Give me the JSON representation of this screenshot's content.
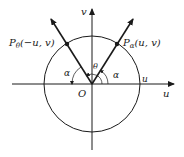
{
  "diagram": {
    "axes": {
      "horizontal_label": "u",
      "vertical_label": "v",
      "origin_label": "O"
    },
    "circle_intercept_label": "u",
    "points": [
      {
        "name": "P",
        "subscript": "α",
        "coords": "(u, v)"
      },
      {
        "name": "P",
        "subscript": "θ",
        "coords": "(−u, v)"
      }
    ],
    "angles": {
      "left_alpha": "α",
      "right_alpha": "α",
      "theta": "θ"
    },
    "colors": {
      "stroke": "#1a1a1a",
      "background": "#ffffff"
    }
  }
}
